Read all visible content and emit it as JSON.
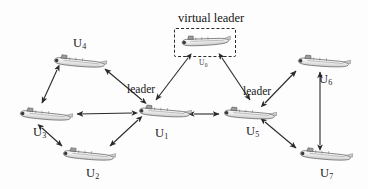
{
  "figure": {
    "width": 368,
    "height": 189,
    "background_color": "#fdfdfd",
    "title_label": "virtual leader",
    "role_labels": [
      {
        "text": "leader",
        "x": 127,
        "y": 83
      },
      {
        "text": "leader",
        "x": 243,
        "y": 85
      }
    ],
    "virtual_leader_box": {
      "x": 174,
      "y": 28,
      "width": 62,
      "height": 29
    }
  },
  "nodes": [
    {
      "id": "U0",
      "label": "U",
      "sub": "0",
      "x": 179,
      "y": 33,
      "w": 52,
      "h": 16,
      "rot": -4,
      "label_x": 199,
      "label_y": 58,
      "size": "small",
      "virtual": true
    },
    {
      "id": "U1",
      "label": "U",
      "sub": "1",
      "x": 136,
      "y": 104,
      "w": 56,
      "h": 16,
      "rot": 3,
      "label_x": 155,
      "label_y": 126,
      "size": "normal",
      "virtual": false
    },
    {
      "id": "U2",
      "label": "U",
      "sub": "2",
      "x": 60,
      "y": 147,
      "w": 56,
      "h": 16,
      "rot": 4,
      "label_x": 86,
      "label_y": 166,
      "size": "normal",
      "virtual": false
    },
    {
      "id": "U3",
      "label": "U",
      "sub": "3",
      "x": 17,
      "y": 107,
      "w": 56,
      "h": 16,
      "rot": 4,
      "label_x": 33,
      "label_y": 125,
      "size": "normal",
      "virtual": false
    },
    {
      "id": "U4",
      "label": "U",
      "sub": "4",
      "x": 51,
      "y": 54,
      "w": 56,
      "h": 16,
      "rot": 4,
      "label_x": 73,
      "label_y": 36,
      "size": "normal",
      "virtual": false
    },
    {
      "id": "U5",
      "label": "U",
      "sub": "5",
      "x": 221,
      "y": 106,
      "w": 56,
      "h": 16,
      "rot": 3,
      "label_x": 246,
      "label_y": 124,
      "size": "normal",
      "virtual": false
    },
    {
      "id": "U6",
      "label": "U",
      "sub": "6",
      "x": 295,
      "y": 54,
      "w": 56,
      "h": 16,
      "rot": 3,
      "label_x": 319,
      "label_y": 72,
      "size": "normal",
      "virtual": false
    },
    {
      "id": "U7",
      "label": "U",
      "sub": "7",
      "x": 297,
      "y": 147,
      "w": 56,
      "h": 16,
      "rot": 4,
      "label_x": 320,
      "label_y": 166,
      "size": "normal",
      "virtual": false
    }
  ],
  "edges": [
    {
      "from": "U0",
      "to": "U1",
      "arrow": "both",
      "x1": 188,
      "y1": 58,
      "x2": 156,
      "y2": 100
    },
    {
      "from": "U0",
      "to": "U5",
      "arrow": "both",
      "x1": 222,
      "y1": 58,
      "x2": 250,
      "y2": 100
    },
    {
      "from": "U1",
      "to": "U4",
      "arrow": "both",
      "x1": 142,
      "y1": 100,
      "x2": 105,
      "y2": 69
    },
    {
      "from": "U1",
      "to": "U3",
      "arrow": "both",
      "x1": 132,
      "y1": 113,
      "x2": 77,
      "y2": 114
    },
    {
      "from": "U1",
      "to": "U2",
      "arrow": "both",
      "x1": 138,
      "y1": 120,
      "x2": 110,
      "y2": 146
    },
    {
      "from": "U4",
      "to": "U3",
      "arrow": "both",
      "x1": 57,
      "y1": 70,
      "x2": 42,
      "y2": 103
    },
    {
      "from": "U3",
      "to": "U2",
      "arrow": "both",
      "x1": 42,
      "y1": 128,
      "x2": 62,
      "y2": 146
    },
    {
      "from": "U1",
      "to": "U5",
      "arrow": "both",
      "x1": 194,
      "y1": 114,
      "x2": 219,
      "y2": 114
    },
    {
      "from": "U5",
      "to": "U6",
      "arrow": "both",
      "x1": 265,
      "y1": 103,
      "x2": 296,
      "y2": 71
    },
    {
      "from": "U5",
      "to": "U7",
      "arrow": "both",
      "x1": 265,
      "y1": 122,
      "x2": 296,
      "y2": 148
    },
    {
      "from": "U6",
      "to": "U7",
      "arrow": "both",
      "x1": 320,
      "y1": 145,
      "x2": 320,
      "y2": 72
    }
  ],
  "colors": {
    "arrow": "#2a2a2a",
    "text": "#141414",
    "submarine_body": "#e7e7e7",
    "submarine_outline": "#5a5a5a"
  }
}
